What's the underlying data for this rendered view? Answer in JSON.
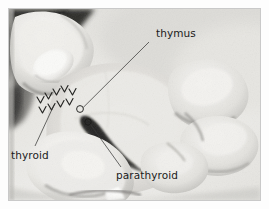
{
  "figure": {
    "type": "photograph",
    "color_mode": "grayscale",
    "border_color": "#c9c9c9",
    "background_color": "#ffffff"
  },
  "annotations": {
    "labels": [
      {
        "id": "thymus",
        "text": "thymus",
        "marker": "circle",
        "marker_x": 71,
        "marker_y": 100,
        "leader_from_x": 140,
        "leader_from_y": 33,
        "text_color": "#1a1a1a"
      },
      {
        "id": "thyroid",
        "text": "thyroid",
        "marker": "chevrons",
        "marker_x": 48,
        "marker_y": 96,
        "leader_from_x": 26,
        "leader_from_y": 138,
        "text_color": "#1a1a1a"
      },
      {
        "id": "parathyroid",
        "text": "parathyroid",
        "marker": "circle",
        "marker_x": 79,
        "marker_y": 113,
        "leader_from_x": 110,
        "leader_from_y": 163,
        "text_color": "#1a1a1a"
      }
    ],
    "chevron_marks": {
      "glyph": "v",
      "count": 9,
      "color": "#2a2a2a",
      "description": "row of small v-shaped arrowheads outlining the thyroid gland"
    },
    "leader_line_color": "#3a3a3a",
    "leader_line_width": 0.7
  }
}
